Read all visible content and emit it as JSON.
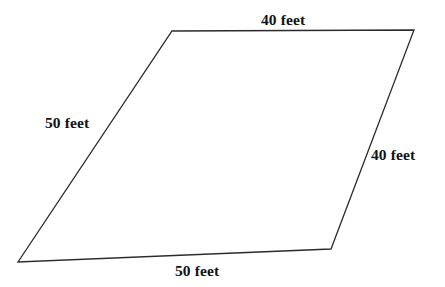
{
  "figure": {
    "name": "parallelogram-with-side-lengths",
    "shape_type": "parallelogram",
    "background_color": "#ffffff",
    "stroke_color": "#2b2b2b",
    "stroke_width": 1.3,
    "fill": "none",
    "units": "feet",
    "vertices": [
      {
        "name": "top-left",
        "x": 172,
        "y": 31
      },
      {
        "name": "top-right",
        "x": 414,
        "y": 30
      },
      {
        "name": "bottom-right",
        "x": 331,
        "y": 249
      },
      {
        "name": "bottom-left",
        "x": 18,
        "y": 262
      }
    ],
    "points_attr": "172,31 414,30 331,249 18,262",
    "sides": [
      {
        "position": "top",
        "label": "40 feet",
        "value": 40,
        "unit": "feet"
      },
      {
        "position": "right",
        "label": "40 feet",
        "value": 40,
        "unit": "feet"
      },
      {
        "position": "bottom",
        "label": "50 feet",
        "value": 50,
        "unit": "feet"
      },
      {
        "position": "left",
        "label": "50 feet",
        "value": 50,
        "unit": "feet"
      }
    ]
  }
}
